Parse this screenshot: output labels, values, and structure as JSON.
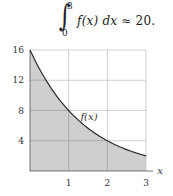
{
  "formula": {
    "integral_symbol": "∫",
    "lower_limit": "0",
    "upper_limit": "3",
    "integrand": "f(x) dx",
    "relation": "≈",
    "value": "20."
  },
  "chart_data": {
    "type": "area",
    "title": "",
    "xlabel": "x",
    "ylabel": "",
    "curve_label": "f(x)",
    "function": "f(x) = 16·2^(-x)",
    "x": [
      0,
      0.5,
      1,
      1.5,
      2,
      2.5,
      3
    ],
    "values": [
      16,
      11.31,
      8,
      5.66,
      4,
      2.83,
      2
    ],
    "xlim": [
      0,
      3
    ],
    "ylim": [
      0,
      16
    ],
    "x_ticks": [
      "1",
      "2",
      "3"
    ],
    "y_ticks": [
      "4",
      "8",
      "12",
      "16"
    ],
    "grid": true,
    "shaded_region": {
      "from": 0,
      "to": 3,
      "label": "area under f(x)"
    },
    "integral_estimate": 20,
    "legend": null
  },
  "colors": {
    "fill": "#cfcfcf",
    "curve": "#2a2a2a",
    "grid": "#c4c4c4",
    "grid_on_fill": "#a8a8a8",
    "axis": "#555555"
  }
}
